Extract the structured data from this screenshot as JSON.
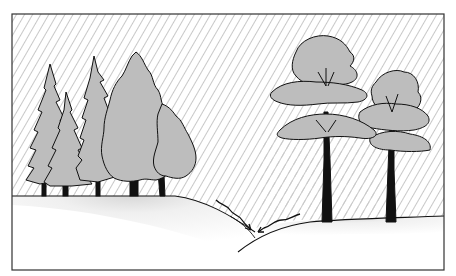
{
  "illustration": {
    "description": "Line illustration of rain falling on a conifer and deciduous forest over hilly ground, with arrows showing runoff meeting in a valley",
    "colors": {
      "background": "#ffffff",
      "foliage": "#bdbdbd",
      "outline": "#111111",
      "rain_hatch": "#c8c8c8",
      "frame": "#333333"
    },
    "elements": {
      "frame": "rectangular border",
      "rain": "diagonal hatching across the sky",
      "left_group": "cluster of conifers and broadleaf trees on a hill",
      "right_group": "two tall broadleaf trees with layered canopy",
      "ground": "stippled hills with a valley",
      "arrows": "two wavy arrows converging toward the valley"
    }
  }
}
